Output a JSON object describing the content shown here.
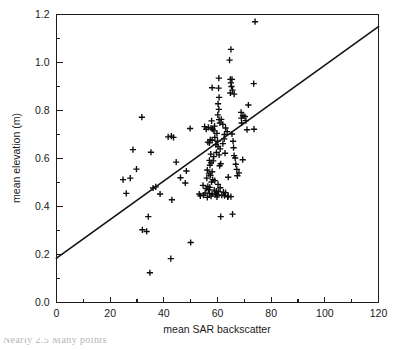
{
  "figure": {
    "background": "#ffffff",
    "ink_color": "#1a1a1a",
    "caption_fragment": "Nearly 2.5  Many points"
  },
  "chart_data": {
    "type": "scatter",
    "title": "",
    "subtitle": "",
    "xlabel": "mean SAR backscatter",
    "ylabel": "mean elevation (m)",
    "xlim": [
      0,
      120
    ],
    "ylim": [
      0.0,
      1.2
    ],
    "xticks": [
      0,
      20,
      40,
      60,
      80,
      100,
      120
    ],
    "xticklabels": [
      "0",
      "20",
      "40",
      "60",
      "80",
      "100",
      "120"
    ],
    "xminorticks": [
      10,
      30,
      50,
      70,
      90,
      110
    ],
    "yticks": [
      0.0,
      0.2,
      0.4,
      0.6,
      0.8,
      1.0,
      1.2
    ],
    "yticklabels": [
      "0.0",
      "0.2",
      "0.4",
      "0.6",
      "0.8",
      "1.0",
      "1.2"
    ],
    "yminorticks": [
      0.1,
      0.3,
      0.5,
      0.7,
      0.9,
      1.1
    ],
    "grid": false,
    "legend": null,
    "legend_position": "none",
    "marker_style": "plus",
    "marker_color": "#0d0d0d",
    "point_count": 148,
    "series": [
      {
        "name": "sites",
        "marker": "plus",
        "color": "#0d0d0d",
        "points": [
          [
            74.0,
            1.17
          ],
          [
            65.0,
            1.055
          ],
          [
            64.5,
            1.01
          ],
          [
            60.5,
            0.935
          ],
          [
            64.8,
            0.93
          ],
          [
            65.4,
            0.93
          ],
          [
            65.0,
            0.915
          ],
          [
            73.5,
            0.912
          ],
          [
            58.0,
            0.895
          ],
          [
            60.4,
            0.893
          ],
          [
            65.2,
            0.9
          ],
          [
            65.6,
            0.885
          ],
          [
            64.8,
            0.873
          ],
          [
            66.2,
            0.868
          ],
          [
            60.6,
            0.855
          ],
          [
            60.2,
            0.828
          ],
          [
            71.5,
            0.823
          ],
          [
            60.5,
            0.805
          ],
          [
            68.8,
            0.792
          ],
          [
            60.1,
            0.782
          ],
          [
            69.5,
            0.778
          ],
          [
            70.2,
            0.775
          ],
          [
            68.9,
            0.768
          ],
          [
            60.6,
            0.762
          ],
          [
            61.4,
            0.763
          ],
          [
            70.6,
            0.758
          ],
          [
            31.8,
            0.772
          ],
          [
            57.8,
            0.757
          ],
          [
            60.9,
            0.748
          ],
          [
            69.0,
            0.748
          ],
          [
            62.0,
            0.742
          ],
          [
            58.9,
            0.735
          ],
          [
            55.2,
            0.733
          ],
          [
            56.6,
            0.73
          ],
          [
            57.6,
            0.727
          ],
          [
            63.0,
            0.727
          ],
          [
            49.8,
            0.725
          ],
          [
            55.8,
            0.722
          ],
          [
            58.2,
            0.722
          ],
          [
            73.6,
            0.722
          ],
          [
            71.0,
            0.72
          ],
          [
            58.7,
            0.715
          ],
          [
            63.6,
            0.712
          ],
          [
            59.8,
            0.705
          ],
          [
            65.4,
            0.702
          ],
          [
            62.6,
            0.7
          ],
          [
            42.8,
            0.693
          ],
          [
            41.6,
            0.69
          ],
          [
            43.6,
            0.688
          ],
          [
            59.0,
            0.688
          ],
          [
            62.5,
            0.682
          ],
          [
            57.3,
            0.678
          ],
          [
            58.0,
            0.676
          ],
          [
            60.0,
            0.672
          ],
          [
            65.8,
            0.672
          ],
          [
            56.4,
            0.668
          ],
          [
            57.0,
            0.665
          ],
          [
            62.0,
            0.662
          ],
          [
            59.4,
            0.658
          ],
          [
            60.2,
            0.65
          ],
          [
            66.0,
            0.645
          ],
          [
            61.0,
            0.64
          ],
          [
            28.5,
            0.637
          ],
          [
            35.2,
            0.626
          ],
          [
            59.6,
            0.625
          ],
          [
            62.8,
            0.622
          ],
          [
            57.5,
            0.618
          ],
          [
            60.6,
            0.615
          ],
          [
            66.2,
            0.612
          ],
          [
            58.6,
            0.608
          ],
          [
            66.6,
            0.602
          ],
          [
            69.4,
            0.595
          ],
          [
            57.0,
            0.592
          ],
          [
            58.4,
            0.59
          ],
          [
            44.6,
            0.585
          ],
          [
            57.6,
            0.582
          ],
          [
            61.2,
            0.578
          ],
          [
            66.8,
            0.576
          ],
          [
            57.2,
            0.572
          ],
          [
            60.8,
            0.57
          ],
          [
            29.8,
            0.556
          ],
          [
            67.2,
            0.555
          ],
          [
            56.2,
            0.552
          ],
          [
            48.4,
            0.548
          ],
          [
            58.0,
            0.545
          ],
          [
            68.0,
            0.54
          ],
          [
            56.8,
            0.536
          ],
          [
            57.4,
            0.53
          ],
          [
            67.4,
            0.528
          ],
          [
            64.0,
            0.522
          ],
          [
            46.2,
            0.52
          ],
          [
            56.0,
            0.518
          ],
          [
            24.8,
            0.512
          ],
          [
            27.5,
            0.518
          ],
          [
            58.2,
            0.512
          ],
          [
            59.0,
            0.508
          ],
          [
            57.8,
            0.502
          ],
          [
            48.0,
            0.498
          ],
          [
            60.2,
            0.492
          ],
          [
            54.6,
            0.488
          ],
          [
            56.4,
            0.484
          ],
          [
            57.1,
            0.48
          ],
          [
            61.0,
            0.478
          ],
          [
            55.8,
            0.475
          ],
          [
            36.0,
            0.477
          ],
          [
            37.0,
            0.482
          ],
          [
            56.6,
            0.47
          ],
          [
            58.8,
            0.468
          ],
          [
            59.6,
            0.464
          ],
          [
            60.4,
            0.462
          ],
          [
            62.2,
            0.46
          ],
          [
            63.0,
            0.458
          ],
          [
            55.4,
            0.456
          ],
          [
            57.0,
            0.455
          ],
          [
            58.0,
            0.452
          ],
          [
            59.2,
            0.45
          ],
          [
            60.0,
            0.448
          ],
          [
            61.6,
            0.447
          ],
          [
            62.6,
            0.445
          ],
          [
            53.2,
            0.452
          ],
          [
            53.6,
            0.444
          ],
          [
            54.8,
            0.447
          ],
          [
            64.0,
            0.443
          ],
          [
            65.0,
            0.441
          ],
          [
            63.8,
            0.44
          ],
          [
            26.0,
            0.455
          ],
          [
            38.6,
            0.452
          ],
          [
            43.0,
            0.428
          ],
          [
            57.6,
            0.443
          ],
          [
            59.8,
            0.44
          ],
          [
            56.2,
            0.438
          ],
          [
            65.6,
            0.368
          ],
          [
            61.2,
            0.358
          ],
          [
            34.2,
            0.358
          ],
          [
            32.0,
            0.303
          ],
          [
            33.6,
            0.296
          ],
          [
            50.0,
            0.25
          ],
          [
            42.6,
            0.183
          ],
          [
            34.8,
            0.124
          ]
        ]
      }
    ],
    "fit_line": {
      "name": "regression line",
      "x_start": 0,
      "y_start": 0.185,
      "x_end": 120,
      "y_end": 1.15,
      "color": "#141414"
    }
  }
}
